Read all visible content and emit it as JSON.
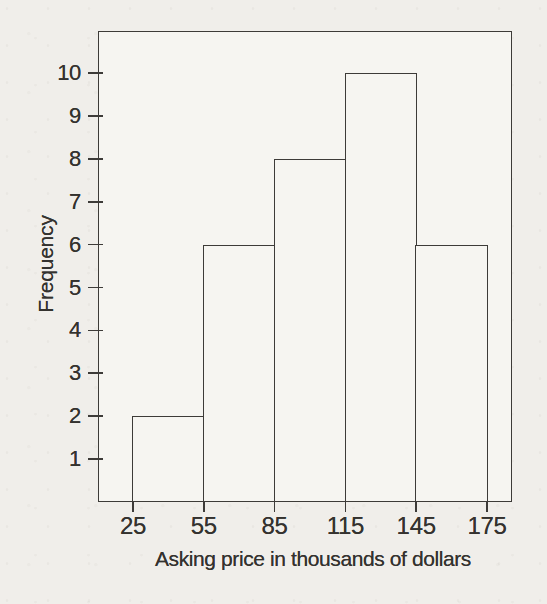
{
  "chart_data": {
    "type": "bar",
    "subtype": "histogram",
    "title": "",
    "xlabel": "Asking price in thousands of dollars",
    "ylabel": "Frequency",
    "bin_edges": [
      25,
      55,
      85,
      115,
      145,
      175
    ],
    "frequencies": [
      2,
      6,
      8,
      10,
      6
    ],
    "bins": [
      {
        "range": "25-55",
        "frequency": 2
      },
      {
        "range": "55-85",
        "frequency": 6
      },
      {
        "range": "85-115",
        "frequency": 8
      },
      {
        "range": "115-145",
        "frequency": 10
      },
      {
        "range": "145-175",
        "frequency": 6
      }
    ],
    "x_tick_labels": [
      "25",
      "55",
      "85",
      "115",
      "145",
      "175"
    ],
    "y_tick_labels": [
      "1",
      "2",
      "3",
      "4",
      "5",
      "6",
      "7",
      "8",
      "9",
      "10"
    ],
    "ylim": [
      0,
      11
    ],
    "grid": "off",
    "legend": "none",
    "colors": {
      "line": "#3d3b38",
      "bar_fill": "#f6f5f1",
      "page_background": "#f0eeea",
      "text": "#34322f"
    }
  }
}
